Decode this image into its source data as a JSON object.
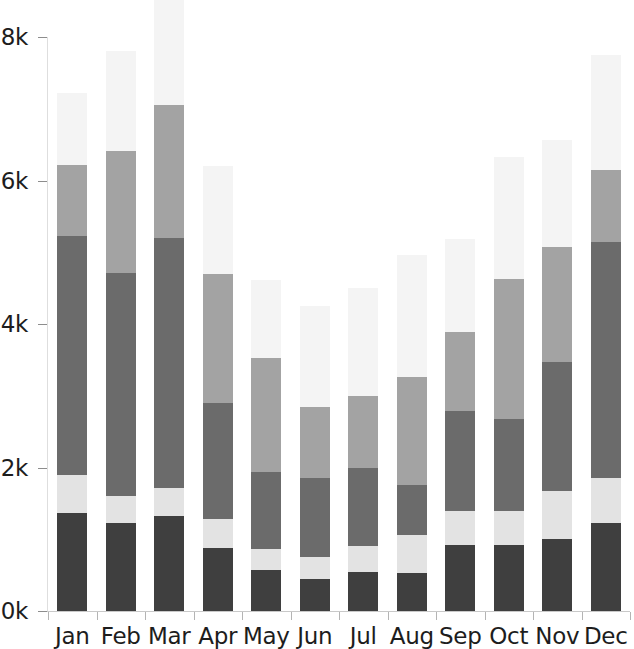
{
  "chart_data": {
    "type": "bar",
    "stacked": true,
    "title": "",
    "subtitle": "",
    "xlabel": "",
    "ylabel": "",
    "grid": false,
    "legend": "none",
    "orientation": "vertical",
    "categories": [
      "Jan",
      "Feb",
      "Mar",
      "Apr",
      "May",
      "Jun",
      "Jul",
      "Aug",
      "Sep",
      "Oct",
      "Nov",
      "Dec"
    ],
    "ylim": [
      0,
      8000
    ],
    "yticks": [
      0,
      2000,
      4000,
      6000,
      8000
    ],
    "ytick_labels": [
      "0k",
      "2k",
      "4k",
      "6k",
      "8k"
    ],
    "series": [
      {
        "name": "series-1",
        "color": "#3f3f3f",
        "values": [
          1370,
          1230,
          1330,
          880,
          570,
          450,
          550,
          530,
          920,
          920,
          1010,
          1230
        ]
      },
      {
        "name": "series-2",
        "color": "#e3e3e3",
        "values": [
          530,
          380,
          380,
          400,
          300,
          300,
          350,
          530,
          470,
          480,
          660,
          630
        ]
      },
      {
        "name": "series-3",
        "color": "#6b6b6b",
        "values": [
          3320,
          3100,
          3490,
          1620,
          1070,
          1100,
          1100,
          700,
          1400,
          1270,
          1800,
          3290
        ]
      },
      {
        "name": "series-4",
        "color": "#a3a3a3",
        "values": [
          1000,
          1700,
          1850,
          1800,
          1580,
          1000,
          1000,
          1500,
          1100,
          1960,
          1600,
          1000
        ]
      },
      {
        "name": "series-5",
        "color": "#f4f4f4",
        "values": [
          1000,
          1400,
          1600,
          1500,
          1100,
          1400,
          1500,
          1700,
          1300,
          1700,
          1500,
          1600
        ]
      }
    ],
    "totals": [
      7220,
      7810,
      8650,
      6200,
      4620,
      4250,
      4500,
      4960,
      5190,
      6330,
      6570,
      7750
    ]
  },
  "axes": {
    "y_tick_labels": [
      "8k",
      "6k",
      "4k",
      "2k",
      "0k"
    ],
    "x_tick_labels": [
      "Jan",
      "Feb",
      "Mar",
      "Apr",
      "May",
      "Jun",
      "Jul",
      "Aug",
      "Sep",
      "Oct",
      "Nov",
      "Dec"
    ]
  },
  "colors": {
    "background": "#ffffff",
    "axis_line": "#c9c9c9",
    "tick_mark": "#8d8d8d",
    "text": "#1d1d1d"
  }
}
